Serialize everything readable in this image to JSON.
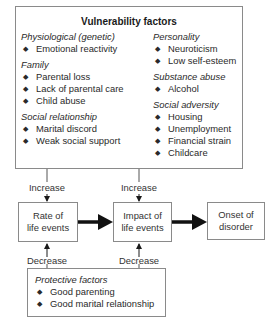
{
  "vulnerability": {
    "title": "Vulnerability factors",
    "left_column": [
      {
        "category": "Physiological (genetic)",
        "items": [
          "Emotional reactivity"
        ]
      },
      {
        "category": "Family",
        "items": [
          "Parental loss",
          "Lack of parental care",
          "Child abuse"
        ]
      },
      {
        "category": "Social relationship",
        "items": [
          "Marital discord",
          "Weak social support"
        ]
      }
    ],
    "right_column": [
      {
        "category": "Personality",
        "items": [
          "Neuroticism",
          "Low self-esteem"
        ]
      },
      {
        "category": "Substance abuse",
        "items": [
          "Alcohol"
        ]
      },
      {
        "category": "Social adversity",
        "items": [
          "Housing",
          "Unemployment",
          "Financial strain",
          "Childcare"
        ]
      }
    ]
  },
  "flow": {
    "nodes": [
      "Rate of\nlife events",
      "Impact of\nlife events",
      "Onset of\ndisorder"
    ],
    "node1_line1": "Rate of",
    "node1_line2": "life events",
    "node2_line1": "Impact of",
    "node2_line2": "life events",
    "node3_line1": "Onset of",
    "node3_line2": "disorder"
  },
  "edges": {
    "increase_label": "Increase",
    "decrease_label": "Decrease"
  },
  "protective": {
    "category": "Protective factors",
    "items": [
      "Good parenting",
      "Good marital relationship"
    ]
  },
  "bullet_glyph": "◆"
}
